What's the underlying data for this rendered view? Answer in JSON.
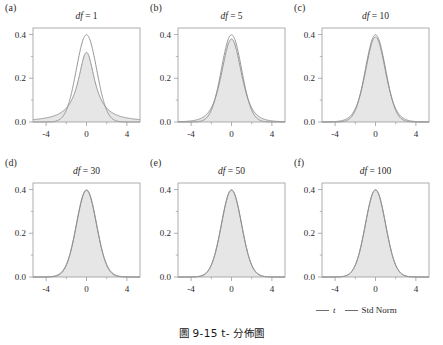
{
  "figure": {
    "caption": "圖 9-15  t- 分佈圖",
    "background": "#ffffff"
  },
  "legend": {
    "position": "bottom-right",
    "entries": [
      {
        "label": "t",
        "color": "#6e6e6e",
        "style": "italic"
      },
      {
        "label": "Std Norm",
        "color": "#6e6e6e",
        "style": "upright"
      }
    ]
  },
  "panels": [
    {
      "tag": "(a)",
      "title_prefix": "df",
      "title_eq": " = ",
      "title_value": "1",
      "df": 1
    },
    {
      "tag": "(b)",
      "title_prefix": "df",
      "title_eq": " = ",
      "title_value": "5",
      "df": 5
    },
    {
      "tag": "(c)",
      "title_prefix": "df",
      "title_eq": " = ",
      "title_value": "10",
      "df": 10
    },
    {
      "tag": "(d)",
      "title_prefix": "df",
      "title_eq": " = ",
      "title_value": "30",
      "df": 30
    },
    {
      "tag": "(e)",
      "title_prefix": "df",
      "title_eq": " = ",
      "title_value": "50",
      "df": 50
    },
    {
      "tag": "(f)",
      "title_prefix": "df",
      "title_eq": " = ",
      "title_value": "100",
      "df": 100
    }
  ],
  "axes": {
    "xlim": [
      -5.3,
      5.3
    ],
    "ylim": [
      0,
      0.43
    ],
    "x_major_ticks": [
      -4,
      0,
      4
    ],
    "x_minor_ticks": [
      -2,
      2
    ],
    "x_tick_labels": [
      "-4",
      "0",
      "4"
    ],
    "y_major_ticks": [
      0.0,
      0.2,
      0.4
    ],
    "y_minor_ticks": [
      0.1,
      0.3
    ],
    "y_tick_labels": [
      "0.0",
      "0.2",
      "0.4"
    ],
    "grid": false,
    "frame_color": "#9a9a9a"
  },
  "chart_data": {
    "type": "line",
    "title": "圖 9-15  t- 分佈圖",
    "xlabel": "",
    "ylabel": "",
    "xlim": [
      -5.3,
      5.3
    ],
    "ylim": [
      0,
      0.43
    ],
    "grid": false,
    "legend": [
      "t",
      "Std Norm"
    ],
    "legend_position": "bottom-right",
    "subplots": [
      {
        "panel": "(a)",
        "title": "df = 1",
        "df": 1,
        "series": [
          {
            "name": "t",
            "fill": "#e6e6e6",
            "color": "#8a8a8a",
            "peak": 0.3183,
            "x": [
              -5,
              -4.5,
              -4,
              -3.5,
              -3,
              -2.5,
              -2,
              -1.5,
              -1,
              -0.5,
              0,
              0.5,
              1,
              1.5,
              2,
              2.5,
              3,
              3.5,
              4,
              4.5,
              5
            ],
            "y": [
              0.0122,
              0.015,
              0.0187,
              0.024,
              0.0318,
              0.0439,
              0.0637,
              0.0979,
              0.1592,
              0.2546,
              0.3183,
              0.2546,
              0.1592,
              0.0979,
              0.0637,
              0.0439,
              0.0318,
              0.024,
              0.0187,
              0.015,
              0.0122
            ]
          },
          {
            "name": "Std Norm",
            "color": "#8a8a8a",
            "peak": 0.3989,
            "x": [
              -5,
              -4.5,
              -4,
              -3.5,
              -3,
              -2.5,
              -2,
              -1.5,
              -1,
              -0.5,
              0,
              0.5,
              1,
              1.5,
              2,
              2.5,
              3,
              3.5,
              4,
              4.5,
              5
            ],
            "y": [
              0.0,
              0.0,
              0.0001,
              0.0009,
              0.0044,
              0.0175,
              0.054,
              0.1295,
              0.242,
              0.3521,
              0.3989,
              0.3521,
              0.242,
              0.1295,
              0.054,
              0.0175,
              0.0044,
              0.0009,
              0.0001,
              0.0,
              0.0
            ]
          }
        ]
      },
      {
        "panel": "(b)",
        "title": "df = 5",
        "df": 5,
        "series": [
          {
            "name": "t",
            "fill": "#e6e6e6",
            "color": "#8a8a8a",
            "peak": 0.3796,
            "x": [
              -5,
              -4,
              -3,
              -2,
              -1,
              0,
              1,
              2,
              3,
              4,
              5
            ],
            "y": [
              0.0019,
              0.0051,
              0.0173,
              0.0651,
              0.2197,
              0.3796,
              0.2197,
              0.0651,
              0.0173,
              0.0051,
              0.0019
            ]
          },
          {
            "name": "Std Norm",
            "color": "#8a8a8a",
            "peak": 0.3989,
            "x": [
              -5,
              -4,
              -3,
              -2,
              -1,
              0,
              1,
              2,
              3,
              4,
              5
            ],
            "y": [
              0.0,
              0.0001,
              0.0044,
              0.054,
              0.242,
              0.3989,
              0.242,
              0.054,
              0.0044,
              0.0001,
              0.0
            ]
          }
        ]
      },
      {
        "panel": "(c)",
        "title": "df = 10",
        "df": 10,
        "series": [
          {
            "name": "t",
            "fill": "#e6e6e6",
            "color": "#8a8a8a",
            "peak": 0.3891,
            "x": [
              -5,
              -4,
              -3,
              -2,
              -1,
              0,
              1,
              2,
              3,
              4,
              5
            ],
            "y": [
              0.0005,
              0.002,
              0.0114,
              0.0611,
              0.2304,
              0.3891,
              0.2304,
              0.0611,
              0.0114,
              0.002,
              0.0005
            ]
          },
          {
            "name": "Std Norm",
            "color": "#8a8a8a",
            "peak": 0.3989,
            "x": [
              -5,
              -4,
              -3,
              -2,
              -1,
              0,
              1,
              2,
              3,
              4,
              5
            ],
            "y": [
              0.0,
              0.0001,
              0.0044,
              0.054,
              0.242,
              0.3989,
              0.242,
              0.054,
              0.0044,
              0.0001,
              0.0
            ]
          }
        ]
      },
      {
        "panel": "(d)",
        "title": "df = 30",
        "df": 30,
        "series": [
          {
            "name": "t",
            "fill": "#e6e6e6",
            "color": "#8a8a8a",
            "peak": 0.3957,
            "x": [
              -5,
              -4,
              -3,
              -2,
              -1,
              0,
              1,
              2,
              3,
              4,
              5
            ],
            "y": [
              0.0001,
              0.0005,
              0.0063,
              0.0562,
              0.2384,
              0.3957,
              0.2384,
              0.0562,
              0.0063,
              0.0005,
              0.0001
            ]
          },
          {
            "name": "Std Norm",
            "color": "#8a8a8a",
            "peak": 0.3989,
            "x": [
              -5,
              -4,
              -3,
              -2,
              -1,
              0,
              1,
              2,
              3,
              4,
              5
            ],
            "y": [
              0.0,
              0.0001,
              0.0044,
              0.054,
              0.242,
              0.3989,
              0.242,
              0.054,
              0.0044,
              0.0001,
              0.0
            ]
          }
        ]
      },
      {
        "panel": "(e)",
        "title": "df = 50",
        "df": 50,
        "series": [
          {
            "name": "t",
            "fill": "#e6e6e6",
            "color": "#8a8a8a",
            "peak": 0.397,
            "x": [
              -5,
              -4,
              -3,
              -2,
              -1,
              0,
              1,
              2,
              3,
              4,
              5
            ],
            "y": [
              0.0,
              0.0003,
              0.0055,
              0.0552,
              0.2398,
              0.397,
              0.2398,
              0.0552,
              0.0055,
              0.0003,
              0.0
            ]
          },
          {
            "name": "Std Norm",
            "color": "#8a8a8a",
            "peak": 0.3989,
            "x": [
              -5,
              -4,
              -3,
              -2,
              -1,
              0,
              1,
              2,
              3,
              4,
              5
            ],
            "y": [
              0.0,
              0.0001,
              0.0044,
              0.054,
              0.242,
              0.3989,
              0.242,
              0.054,
              0.0044,
              0.0001,
              0.0
            ]
          }
        ]
      },
      {
        "panel": "(f)",
        "title": "df = 100",
        "df": 100,
        "series": [
          {
            "name": "t",
            "fill": "#e6e6e6",
            "color": "#8a8a8a",
            "peak": 0.3979,
            "x": [
              -5,
              -4,
              -3,
              -2,
              -1,
              0,
              1,
              2,
              3,
              4,
              5
            ],
            "y": [
              0.0,
              0.0002,
              0.0049,
              0.0546,
              0.2409,
              0.3979,
              0.2409,
              0.0546,
              0.0049,
              0.0002,
              0.0
            ]
          },
          {
            "name": "Std Norm",
            "color": "#8a8a8a",
            "peak": 0.3989,
            "x": [
              -5,
              -4,
              -3,
              -2,
              -1,
              0,
              1,
              2,
              3,
              4,
              5
            ],
            "y": [
              0.0,
              0.0001,
              0.0044,
              0.054,
              0.242,
              0.3989,
              0.242,
              0.054,
              0.0044,
              0.0001,
              0.0
            ]
          }
        ]
      }
    ]
  }
}
